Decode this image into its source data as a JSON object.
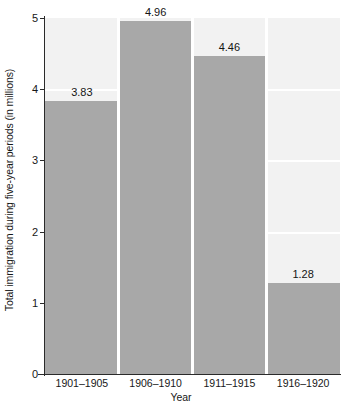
{
  "chart_data": {
    "type": "bar",
    "title": "",
    "categories": [
      "1901–1905",
      "1906–1910",
      "1911–1915",
      "1916–1920"
    ],
    "values": [
      3.83,
      4.96,
      4.46,
      1.28
    ],
    "value_labels": [
      "3.83",
      "4.96",
      "4.46",
      "1.28"
    ],
    "xlabel": "Year",
    "ylabel": "Total immigration during five-year periods (in millions)",
    "ylim": [
      0,
      5
    ],
    "ytick_labels": [
      "0",
      "1",
      "2",
      "3",
      "4",
      "5"
    ],
    "ytick_values": [
      0,
      1,
      2,
      3,
      4,
      5
    ],
    "grid": true,
    "grid_axis": "y",
    "legend": "none",
    "colors": {
      "bar": "#a8a8a8",
      "plot_background": "#f2f2f2",
      "gridline": "#ffffff",
      "axis": "#2a2a2a",
      "text": "#171717"
    }
  }
}
